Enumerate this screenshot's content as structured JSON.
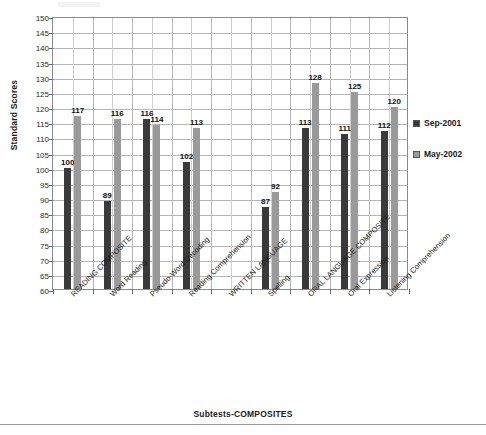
{
  "chart_data": {
    "type": "bar",
    "title": "",
    "xlabel": "Subtests-COMPOSITES",
    "ylabel": "Standard Scores",
    "ylim": [
      60,
      150
    ],
    "ytick_step": 5,
    "yticks": [
      150,
      145,
      140,
      135,
      130,
      125,
      120,
      115,
      110,
      105,
      100,
      95,
      90,
      85,
      80,
      75,
      70,
      65,
      60
    ],
    "grid": true,
    "legend_position": "right",
    "categories": [
      "READING COMPOSITE",
      "Word Reading",
      "Pseudo-Word Decoding",
      "Reading Comprehension",
      "WRITTEN LANGUAGE",
      "Spelling",
      "ORAL LANGUAGE COMPOSITE",
      "Oral Expression",
      "Listening Comprehension"
    ],
    "series": [
      {
        "name": "Sep-2001",
        "color": "#3a3a3a",
        "values": [
          100,
          89,
          116,
          102,
          null,
          87,
          113,
          111,
          112
        ]
      },
      {
        "name": "May-2002",
        "color": "#9a9a9a",
        "values": [
          117,
          116,
          114,
          113,
          null,
          92,
          128,
          125,
          120
        ]
      }
    ]
  },
  "legend": {
    "items": [
      {
        "label": "Sep-2001",
        "color": "#3a3a3a"
      },
      {
        "label": "May-2002",
        "color": "#9a9a9a"
      }
    ]
  },
  "axes": {
    "y_title": "Standard Scores",
    "x_title": "Subtests-COMPOSITES"
  }
}
